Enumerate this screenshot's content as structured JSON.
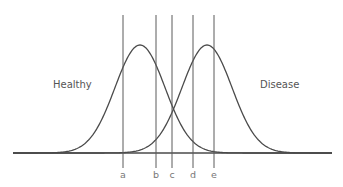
{
  "diagram": {
    "type": "overlapping-normal-distributions",
    "distributions": [
      {
        "name": "healthy",
        "label": "Healthy",
        "peak_x": 140,
        "peak_y": 45,
        "color": "#4a4a4a"
      },
      {
        "name": "disease",
        "label": "Disease",
        "peak_x": 207,
        "peak_y": 45,
        "color": "#4a4a4a"
      }
    ],
    "cutoffs": [
      {
        "label": "a",
        "x": 123
      },
      {
        "label": "b",
        "x": 156
      },
      {
        "label": "c",
        "x": 172
      },
      {
        "label": "d",
        "x": 193
      },
      {
        "label": "e",
        "x": 214
      }
    ],
    "baseline": {
      "y": 153,
      "x_start": 13,
      "x_end": 332
    },
    "colors": {
      "curve": "#4a4a4a",
      "line": "#5a5a5a",
      "text": "#555555",
      "cut_text": "#777777",
      "background": "#ffffff"
    }
  }
}
